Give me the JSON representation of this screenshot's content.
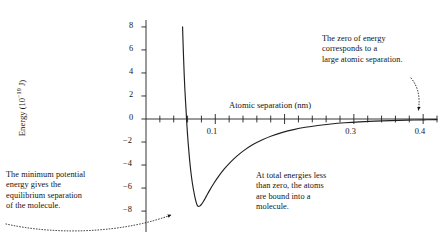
{
  "chart_data": {
    "type": "line",
    "title": "",
    "xlabel": "Atomic separation (nm)",
    "ylabel_text": "Energy (10",
    "ylabel_exponent": "−19",
    "ylabel_tail": " J)",
    "ylabel_full": "Energy (10⁻¹⁹ J)",
    "xlim": [
      0.0,
      0.42
    ],
    "ylim": [
      -8.6,
      8.6
    ],
    "grid": false,
    "legend": "none",
    "x_major_ticks": [
      0.1,
      0.2,
      0.3,
      0.4
    ],
    "x_tick_labels": [
      "0.1",
      "",
      "0.3",
      "0.4"
    ],
    "x_minor_tick_step": 0.02,
    "y_major_ticks": [
      8,
      6,
      4,
      2,
      0,
      -2,
      -4,
      -6,
      -8
    ],
    "y_tick_labels": [
      "8",
      "6",
      "4",
      "2",
      "0",
      "−2",
      "−4",
      "−6",
      "−8"
    ],
    "minimum_point": {
      "x": 0.074,
      "y": -7.6
    },
    "zero_crossing_x": 0.0585,
    "asymptote_y": 0,
    "series": [
      {
        "name": "Interatomic potential energy",
        "color": "#231f20",
        "points": [
          [
            0.0528,
            8.0
          ],
          [
            0.0535,
            6.6
          ],
          [
            0.0543,
            5.2
          ],
          [
            0.0551,
            3.9
          ],
          [
            0.056,
            2.7
          ],
          [
            0.057,
            1.6
          ],
          [
            0.058,
            0.6
          ],
          [
            0.0585,
            0.0
          ],
          [
            0.0592,
            -0.7
          ],
          [
            0.0605,
            -1.8
          ],
          [
            0.062,
            -2.9
          ],
          [
            0.0635,
            -3.9
          ],
          [
            0.0652,
            -4.8
          ],
          [
            0.067,
            -5.6
          ],
          [
            0.069,
            -6.3
          ],
          [
            0.071,
            -6.9
          ],
          [
            0.073,
            -7.35
          ],
          [
            0.0745,
            -7.55
          ],
          [
            0.076,
            -7.6
          ],
          [
            0.078,
            -7.55
          ],
          [
            0.08,
            -7.42
          ],
          [
            0.083,
            -7.15
          ],
          [
            0.087,
            -6.72
          ],
          [
            0.092,
            -6.18
          ],
          [
            0.098,
            -5.58
          ],
          [
            0.105,
            -4.96
          ],
          [
            0.113,
            -4.34
          ],
          [
            0.122,
            -3.74
          ],
          [
            0.132,
            -3.18
          ],
          [
            0.143,
            -2.66
          ],
          [
            0.155,
            -2.2
          ],
          [
            0.168,
            -1.8
          ],
          [
            0.182,
            -1.45
          ],
          [
            0.197,
            -1.16
          ],
          [
            0.213,
            -0.92
          ],
          [
            0.23,
            -0.72
          ],
          [
            0.248,
            -0.56
          ],
          [
            0.267,
            -0.43
          ],
          [
            0.287,
            -0.33
          ],
          [
            0.308,
            -0.25
          ],
          [
            0.33,
            -0.19
          ],
          [
            0.353,
            -0.14
          ],
          [
            0.377,
            -0.1
          ],
          [
            0.402,
            -0.07
          ],
          [
            0.42,
            -0.05
          ]
        ]
      }
    ],
    "annotations": [
      {
        "id": "zero-energy",
        "text": "The zero of energy\ncorresponds to a\nlarge atomic separation.",
        "points_to": {
          "x": 0.41,
          "y": 0
        }
      },
      {
        "id": "minimum-energy",
        "text": "The minimum potential\nenergy gives the\nequilibrium separation\nof the molecule.",
        "points_to": {
          "x": 0.074,
          "y": -7.6
        }
      },
      {
        "id": "bound-atoms",
        "text": "At total energies less\nthan zero, the atoms\nare bound into a\nmolecule.",
        "points_to": null
      }
    ]
  },
  "axes": {
    "x_title": "Atomic separation (nm)",
    "y_title_prefix": "Energy (10",
    "y_title_exponent": "−19",
    "y_title_suffix": " J)"
  }
}
